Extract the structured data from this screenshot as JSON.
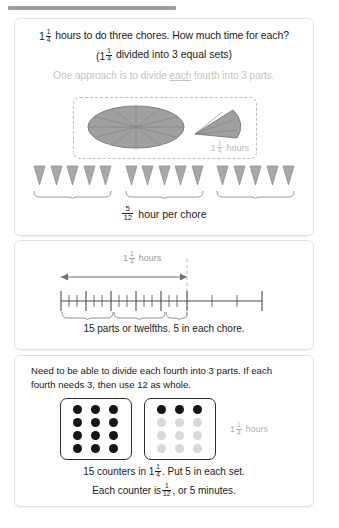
{
  "page": {
    "topbar_present": true,
    "background": "#ffffff",
    "panel_border": "#e2e2e2"
  },
  "panel1": {
    "line1_pre": "1",
    "line1_frac_num": "1",
    "line1_frac_den": "4",
    "line1_post": "hours to do three chores. How much time for each?",
    "line2_pre": "(1",
    "line2_frac_num": "1",
    "line2_frac_den": "4",
    "line2_post": "divided into 3 equal sets)",
    "line3_a": "One approach is to divide ",
    "line3_underlined": "each",
    "line3_b": " fourth into 3 parts.",
    "line3_color": "#c4c4c4",
    "pie": {
      "sectors": 12,
      "wedge_sectors": 3,
      "fill": "#a0a0a0",
      "stroke": "#7d7d7d",
      "label_whole": "1",
      "label_num": "1",
      "label_den": "4",
      "label_unit": "hours",
      "label_color": "#b9b9b9"
    },
    "triangles": {
      "groups": 3,
      "per_group": 5,
      "fill": "#a8a8a8",
      "stroke": "#8f8f8f"
    },
    "result_num": "5",
    "result_den": "12",
    "result_text": "hour per chore"
  },
  "panel2": {
    "arrow_whole": "1",
    "arrow_num": "1",
    "arrow_den": "4",
    "arrow_unit": "hours",
    "arrow_color": "#9a9a9a",
    "caption": "15 parts or twelfths. 5 in each chore.",
    "ticks_total": 20,
    "braces": 3,
    "dashed_divider_at": 15
  },
  "panel3": {
    "need_text": "Need to be able to divide each fourth into 3 parts. If each fourth needs 3, then use 12 as whole.",
    "box_left": {
      "rows": [
        [
          "dark",
          "dark",
          "dark"
        ],
        [
          "dark",
          "dark",
          "dark"
        ],
        [
          "dark",
          "dark",
          "dark"
        ],
        [
          "dark",
          "dark",
          "dark"
        ]
      ]
    },
    "box_right": {
      "rows": [
        [
          "dark",
          "dark",
          "dark"
        ],
        [
          "light",
          "light",
          "light"
        ],
        [
          "light",
          "light",
          "light"
        ],
        [
          "light",
          "light",
          "light"
        ]
      ]
    },
    "hours_whole": "1",
    "hours_num": "1",
    "hours_den": "4",
    "hours_unit": "hours",
    "hours_color": "#b0b0b0",
    "cap1_a": "15 counters in 1",
    "cap1_num": "1",
    "cap1_den": "4",
    "cap1_b": ". Put 5 in each set.",
    "cap2_a": "Each counter is ",
    "cap2_num": "1",
    "cap2_den": "12",
    "cap2_b": ", or 5 minutes."
  },
  "colors": {
    "dot_dark": "#151515",
    "dot_light": "#d9d9d9",
    "pie_fill": "#a0a0a0",
    "triangle_fill": "#a8a8a8",
    "muted_text": "#b9b9b9"
  }
}
